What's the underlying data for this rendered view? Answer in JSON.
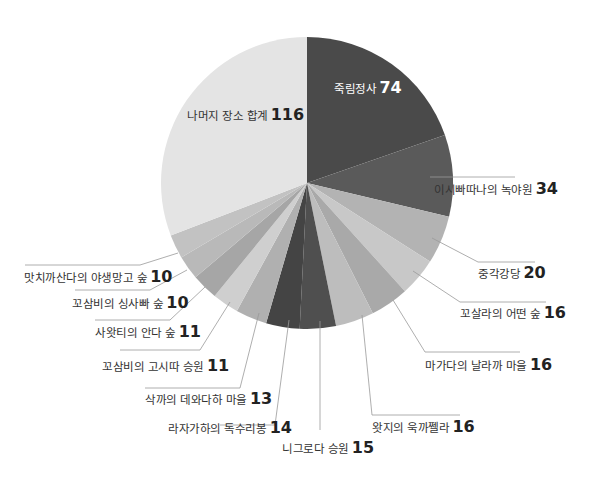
{
  "chart_data": {
    "type": "pie",
    "title": "",
    "start_angle_deg": 0,
    "direction": "clockwise",
    "total": 376,
    "slices": [
      {
        "label": "죽림정사",
        "value": 74,
        "color": "#4a4a4a"
      },
      {
        "label": "이시빠따나의 녹야원",
        "value": 34,
        "color": "#5a5a5a"
      },
      {
        "label": "중각강당",
        "value": 20,
        "color": "#b3b3b3"
      },
      {
        "label": "꼬살라의 어떤 숲",
        "value": 16,
        "color": "#c8c8c8"
      },
      {
        "label": "마가다의 날라까 마을",
        "value": 16,
        "color": "#a9a9a9"
      },
      {
        "label": "왓지의 욱까쩰라",
        "value": 16,
        "color": "#bdbdbd"
      },
      {
        "label": "니그로다 승원",
        "value": 15,
        "color": "#4f4f4f"
      },
      {
        "label": "라자가하의 독수리봉",
        "value": 14,
        "color": "#444444"
      },
      {
        "label": "삭까의 데와다하 마을",
        "value": 13,
        "color": "#b0b0b0"
      },
      {
        "label": "꼬삼비의 고시따 승원",
        "value": 11,
        "color": "#cfcfcf"
      },
      {
        "label": "사왓티의 안다 숲",
        "value": 11,
        "color": "#a6a6a6"
      },
      {
        "label": "꼬삼비의 싱사빠 숲",
        "value": 10,
        "color": "#b9b9b9"
      },
      {
        "label": "맛치까산다의 야생망고 숲",
        "value": 10,
        "color": "#c2c2c2"
      },
      {
        "label": "나머지 장소 합계",
        "value": 116,
        "color": "#e4e4e4"
      }
    ],
    "legend": "none",
    "data_labels": "outside with leader lines (first and last inside)"
  },
  "labels": [
    {
      "name": "죽림정사",
      "value": "74"
    },
    {
      "name": "이시빠따나의 녹야원",
      "value": "34"
    },
    {
      "name": "중각강당",
      "value": "20"
    },
    {
      "name": "꼬살라의 어떤 숲",
      "value": "16"
    },
    {
      "name": "마가다의 날라까 마을",
      "value": "16"
    },
    {
      "name": "왓지의 욱까쩰라",
      "value": "16"
    },
    {
      "name": "니그로다 승원",
      "value": "15"
    },
    {
      "name": "라자가하의 독수리봉",
      "value": "14"
    },
    {
      "name": "삭까의 데와다하 마을",
      "value": "13"
    },
    {
      "name": "꼬삼비의 고시따 승원",
      "value": "11"
    },
    {
      "name": "사왓티의 안다 숲",
      "value": "11"
    },
    {
      "name": "꼬삼비의 싱사빠 숲",
      "value": "10"
    },
    {
      "name": "맛치까산다의 야생망고 숲",
      "value": "10"
    },
    {
      "name": "나머지 장소 합계",
      "value": "116"
    }
  ]
}
